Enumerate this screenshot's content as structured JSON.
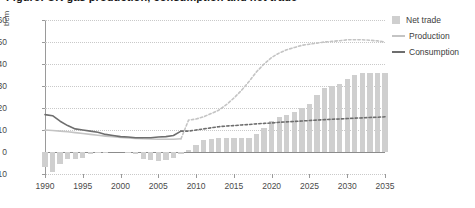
{
  "title": "Figure: UK gas production, consumption and net trade",
  "axis": {
    "ylabel": "bcm",
    "yticks": [
      60,
      50,
      40,
      30,
      20,
      10,
      0,
      -10
    ],
    "xticks": [
      1990,
      1995,
      2000,
      2005,
      2010,
      2015,
      2020,
      2025,
      2030,
      2035
    ]
  },
  "legend": [
    {
      "label": "Net trade",
      "marker": "square",
      "color": "#cfcfcf"
    },
    {
      "label": "Production",
      "marker": "line",
      "color": "#c4c4c4"
    },
    {
      "label": "Consumption",
      "marker": "line",
      "color": "#6e6e6e"
    }
  ],
  "colors": {
    "net_trade": "#cfcfcf",
    "production": "#c4c4c4",
    "consumption": "#6e6e6e",
    "axis": "#9a9a9a",
    "grid": "#c9c9c9"
  },
  "chart_data": {
    "type": "bar",
    "title": "Figure: UK gas production, consumption and net trade",
    "xlabel": "",
    "ylabel": "bcm",
    "ylim": [
      -10,
      60
    ],
    "xlim": [
      1990,
      2035
    ],
    "grid": true,
    "legend_position": "right",
    "forecast_start": 2009,
    "x": [
      1990,
      1991,
      1992,
      1993,
      1994,
      1995,
      1996,
      1997,
      1998,
      1999,
      2000,
      2001,
      2002,
      2003,
      2004,
      2005,
      2006,
      2007,
      2008,
      2009,
      2010,
      2011,
      2012,
      2013,
      2014,
      2015,
      2016,
      2017,
      2018,
      2019,
      2020,
      2021,
      2022,
      2023,
      2024,
      2025,
      2026,
      2027,
      2028,
      2029,
      2030,
      2031,
      2032,
      2033,
      2034,
      2035
    ],
    "series": [
      {
        "name": "Net trade",
        "type": "bar",
        "color": "#cfcfcf",
        "values": [
          -7.0,
          -9.0,
          -5.5,
          -3.0,
          -3.0,
          -2.5,
          -1.0,
          -0.5,
          -0.5,
          0.0,
          0.0,
          -0.5,
          -1.0,
          -3.0,
          -3.5,
          -4.0,
          -3.5,
          -2.5,
          -1.0,
          1.0,
          3.0,
          5.5,
          6.0,
          6.5,
          6.5,
          6.5,
          6.5,
          6.5,
          8.0,
          11.0,
          14.0,
          16.0,
          17.0,
          18.0,
          20.0,
          22.0,
          26.0,
          29.0,
          30.0,
          31.0,
          33.0,
          35.0,
          36.0,
          36.0,
          36.0,
          36.0
        ]
      },
      {
        "name": "Production",
        "type": "line",
        "color": "#c4c4c4",
        "style_historical": "solid",
        "style_forecast": "dashed",
        "values": [
          10.0,
          9.8,
          9.5,
          9.2,
          8.8,
          8.4,
          8.0,
          7.6,
          7.2,
          6.9,
          6.6,
          6.4,
          6.2,
          6.0,
          5.9,
          5.8,
          5.8,
          5.8,
          6.0,
          14.5,
          15.0,
          16.0,
          17.5,
          19.0,
          21.5,
          24.5,
          28.0,
          32.0,
          36.5,
          40.0,
          43.0,
          45.0,
          46.5,
          47.5,
          48.5,
          49.0,
          49.5,
          50.0,
          50.3,
          50.6,
          51.0,
          51.0,
          51.0,
          50.8,
          50.5,
          50.0
        ]
      },
      {
        "name": "Consumption",
        "type": "line",
        "color": "#6e6e6e",
        "style_historical": "solid",
        "style_forecast": "dashed",
        "values": [
          17.0,
          16.5,
          14.0,
          12.0,
          10.5,
          10.0,
          9.5,
          9.0,
          8.0,
          7.5,
          7.0,
          6.8,
          6.5,
          6.5,
          6.5,
          6.8,
          7.0,
          7.5,
          9.5,
          9.5,
          10.0,
          10.5,
          11.0,
          11.5,
          11.8,
          12.0,
          12.3,
          12.5,
          12.8,
          13.0,
          13.2,
          13.5,
          13.7,
          13.9,
          14.1,
          14.3,
          14.5,
          14.7,
          14.9,
          15.0,
          15.2,
          15.4,
          15.5,
          15.7,
          15.8,
          16.0
        ]
      }
    ]
  }
}
